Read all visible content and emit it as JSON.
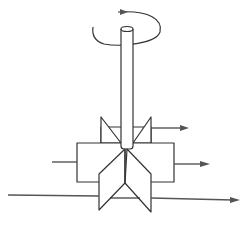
{
  "diagram": {
    "title": "",
    "colors": {
      "line": "#333333",
      "arrow": "#555555",
      "background": "#ffffff"
    },
    "components": [
      {
        "id": "rotation-arrow",
        "kind": "curved-arrow",
        "direction": "counter-clockwise (viewed from top)"
      },
      {
        "id": "shaft",
        "kind": "cylinder",
        "orientation": "vertical"
      },
      {
        "id": "upper-blade-set",
        "kind": "triangular-blades"
      },
      {
        "id": "impeller-box",
        "kind": "rectangle"
      },
      {
        "id": "lower-blade-set",
        "kind": "chevron-blades"
      }
    ],
    "flow_arrows": [
      {
        "id": "upper-outflow",
        "direction": "right"
      },
      {
        "id": "middle-inflow",
        "direction": "into box from left"
      },
      {
        "id": "middle-outflow",
        "direction": "right"
      },
      {
        "id": "bottom-through-flow",
        "direction": "right"
      }
    ]
  }
}
